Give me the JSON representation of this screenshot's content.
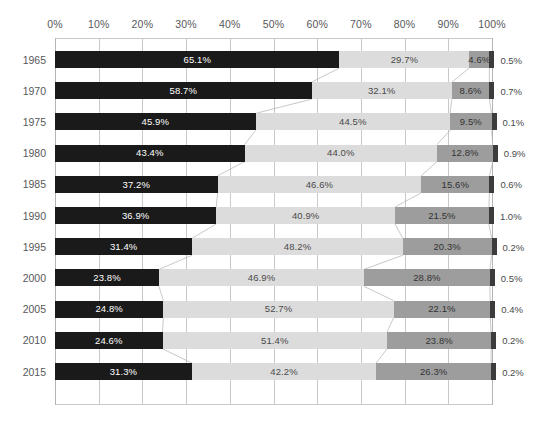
{
  "chart_data": {
    "type": "bar",
    "subtype": "stacked-horizontal-100-percent",
    "title": "",
    "subtitle": "",
    "xlabel": "",
    "ylabel": "",
    "xlim": [
      0,
      100
    ],
    "grid": true,
    "legend_position": "none",
    "x_tick_labels": [
      "0%",
      "10%",
      "20%",
      "30%",
      "40%",
      "50%",
      "60%",
      "70%",
      "80%",
      "90%",
      "100%"
    ],
    "x_tick_values": [
      0,
      10,
      20,
      30,
      40,
      50,
      60,
      70,
      80,
      90,
      100
    ],
    "categories": [
      "1965",
      "1970",
      "1975",
      "1980",
      "1985",
      "1990",
      "1995",
      "2000",
      "2005",
      "2010",
      "2015"
    ],
    "series": [
      {
        "name": "series-1",
        "color": "#1a1a1a",
        "values": [
          65.1,
          58.7,
          45.9,
          43.4,
          37.2,
          36.9,
          31.4,
          23.8,
          24.8,
          24.6,
          31.3
        ]
      },
      {
        "name": "series-2",
        "color": "#dcdcdc",
        "values": [
          29.7,
          32.1,
          44.5,
          44.0,
          46.6,
          40.9,
          48.2,
          46.9,
          52.7,
          51.4,
          42.2
        ]
      },
      {
        "name": "series-3",
        "color": "#9d9d9d",
        "values": [
          4.6,
          8.6,
          9.5,
          12.8,
          15.6,
          21.5,
          20.3,
          28.8,
          22.1,
          23.8,
          26.3
        ]
      },
      {
        "name": "series-4",
        "color": "#3c3c3c",
        "values": [
          0.5,
          0.7,
          0.1,
          0.9,
          0.6,
          1.0,
          0.2,
          0.5,
          0.4,
          0.2,
          0.2
        ]
      }
    ],
    "rows": [
      {
        "category": "1965",
        "values": [
          65.1,
          29.7,
          4.6,
          0.5
        ],
        "labels": [
          "65.1%",
          "29.7%",
          "4.6%",
          "0.5%"
        ]
      },
      {
        "category": "1970",
        "values": [
          58.7,
          32.1,
          8.6,
          0.7
        ],
        "labels": [
          "58.7%",
          "32.1%",
          "8.6%",
          "0.7%"
        ]
      },
      {
        "category": "1975",
        "values": [
          45.9,
          44.5,
          9.5,
          0.1
        ],
        "labels": [
          "45.9%",
          "44.5%",
          "9.5%",
          "0.1%"
        ]
      },
      {
        "category": "1980",
        "values": [
          43.4,
          44.0,
          12.8,
          0.9
        ],
        "labels": [
          "43.4%",
          "44.0%",
          "12.8%",
          "0.9%"
        ]
      },
      {
        "category": "1985",
        "values": [
          37.2,
          46.6,
          15.6,
          0.6
        ],
        "labels": [
          "37.2%",
          "46.6%",
          "15.6%",
          "0.6%"
        ]
      },
      {
        "category": "1990",
        "values": [
          36.9,
          40.9,
          21.5,
          1.0
        ],
        "labels": [
          "36.9%",
          "40.9%",
          "21.5%",
          "1.0%"
        ]
      },
      {
        "category": "1995",
        "values": [
          31.4,
          48.2,
          20.3,
          0.2
        ],
        "labels": [
          "31.4%",
          "48.2%",
          "20.3%",
          "0.2%"
        ]
      },
      {
        "category": "2000",
        "values": [
          23.8,
          46.9,
          28.8,
          0.5
        ],
        "labels": [
          "23.8%",
          "46.9%",
          "28.8%",
          "0.5%"
        ]
      },
      {
        "category": "2005",
        "values": [
          24.8,
          52.7,
          22.1,
          0.4
        ],
        "labels": [
          "24.8%",
          "52.7%",
          "22.1%",
          "0.4%"
        ]
      },
      {
        "category": "2010",
        "values": [
          24.6,
          51.4,
          23.8,
          0.2
        ],
        "labels": [
          "24.6%",
          "51.4%",
          "23.8%",
          "0.2%"
        ]
      },
      {
        "category": "2015",
        "values": [
          31.3,
          42.2,
          26.3,
          0.2
        ],
        "labels": [
          "31.3%",
          "42.2%",
          "26.3%",
          "0.2%"
        ]
      }
    ],
    "colors": {
      "series_1": "#1a1a1a",
      "series_2": "#dcdcdc",
      "series_3": "#9d9d9d",
      "series_4": "#3c3c3c",
      "gridline": "#c8c8c8",
      "connector": "#b0b0b0",
      "axis_text": "#58585a",
      "background": "#ffffff"
    }
  }
}
